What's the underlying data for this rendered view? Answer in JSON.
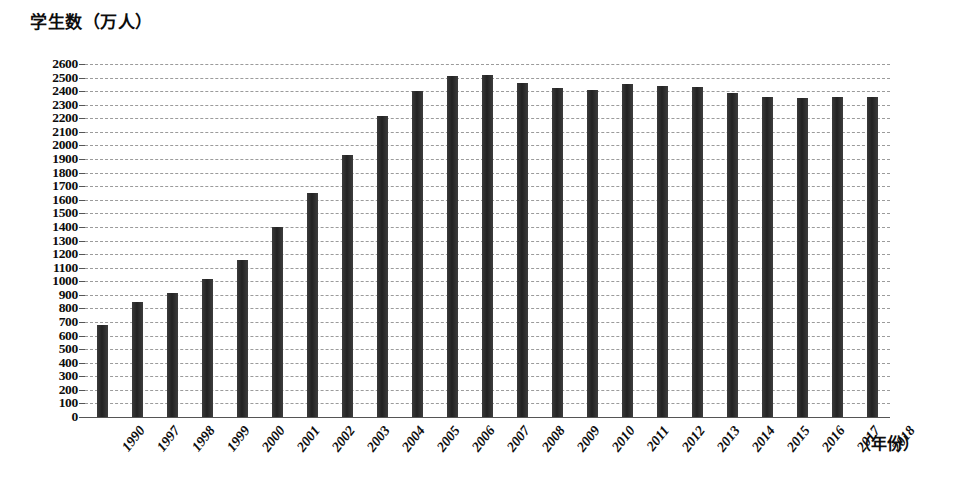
{
  "chart_data": {
    "type": "bar",
    "title": "学生数（万人）",
    "ylabel": "学生数（万人）",
    "xlabel": "（年份）",
    "ylim": [
      0,
      2600
    ],
    "ytick_step": 100,
    "grid": true,
    "legend": "none",
    "bar_color": "#2b2b2b",
    "categories": [
      "1990",
      "1997",
      "1998",
      "1999",
      "2000",
      "2001",
      "2002",
      "2003",
      "2004",
      "2005",
      "2006",
      "2007",
      "2008",
      "2009",
      "2010",
      "2011",
      "2012",
      "2013",
      "2014",
      "2015",
      "2016",
      "2017",
      "2018"
    ],
    "values": [
      680,
      845,
      910,
      1020,
      1160,
      1400,
      1650,
      1930,
      2220,
      2400,
      2515,
      2520,
      2460,
      2420,
      2410,
      2450,
      2440,
      2430,
      2390,
      2360,
      2350,
      2360,
      2360
    ],
    "yticks": [
      "0",
      "100",
      "200",
      "300",
      "400",
      "500",
      "600",
      "700",
      "800",
      "900",
      "1000",
      "1100",
      "1200",
      "1300",
      "1400",
      "1500",
      "1600",
      "1700",
      "1800",
      "1900",
      "2000",
      "2100",
      "2200",
      "2300",
      "2400",
      "2500",
      "2600"
    ]
  }
}
